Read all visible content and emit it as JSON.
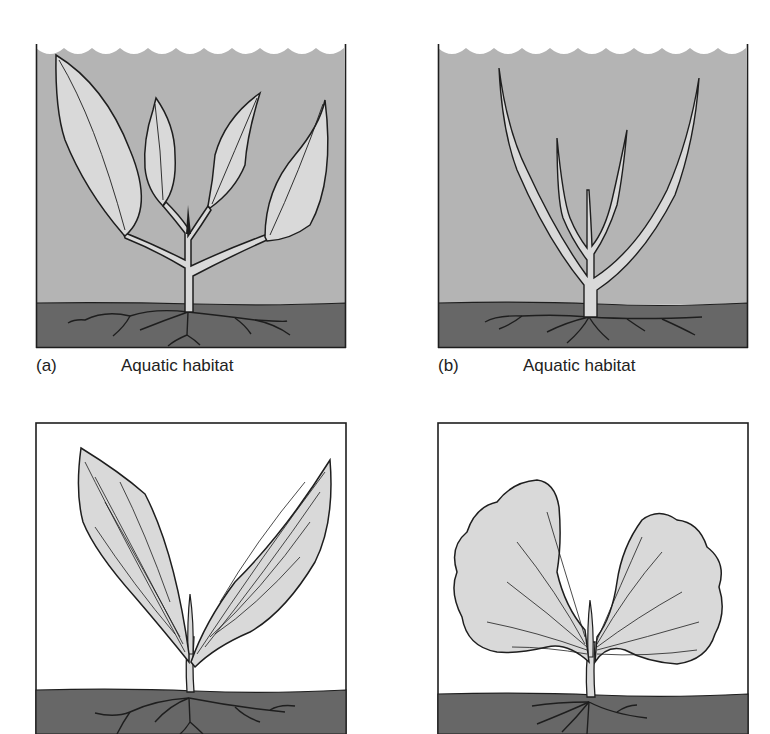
{
  "figure": {
    "colors": {
      "water": "#b4b4b4",
      "soil": "#676767",
      "leaf_fill": "#d9d9d9",
      "outline": "#1e1e1e",
      "background": "#ffffff",
      "terrestrial_bg": "#ffffff"
    },
    "panels": [
      {
        "id": "a",
        "letter": "(a)",
        "habitat": "Aquatic habitat",
        "environment": "water",
        "leaf_form": "broad lanceolate submerged leaves"
      },
      {
        "id": "b",
        "letter": "(b)",
        "habitat": "Aquatic habitat",
        "environment": "water",
        "leaf_form": "narrow linear ribbon leaves"
      },
      {
        "id": "c",
        "letter": "",
        "habitat": "",
        "environment": "air",
        "leaf_form": "long lanceolate parallel-veined leaves"
      },
      {
        "id": "d",
        "letter": "",
        "habitat": "",
        "environment": "air",
        "leaf_form": "broad fan-shaped lobed leaves"
      }
    ]
  }
}
